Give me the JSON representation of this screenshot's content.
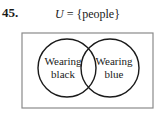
{
  "problem": {
    "number": "45.",
    "universe_label": "U = {people}",
    "universe_var": "U",
    "universe_set": " = {people}"
  },
  "venn": {
    "sets": [
      {
        "line1": "Wearing",
        "line2": "black"
      },
      {
        "line1": "Wearing",
        "line2": "blue"
      }
    ],
    "colors": {
      "stroke": "#1a1a1a",
      "box": "#8a8a8a"
    }
  }
}
